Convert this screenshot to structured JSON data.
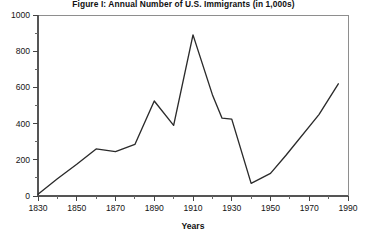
{
  "figure": {
    "title": "Figure I: Annual Number of U.S. Immigrants (in 1,000s)",
    "xlabel": "Years",
    "ylabel": ""
  },
  "chart_data": {
    "type": "line",
    "title": "Figure I: Annual Number of U.S. Immigrants (in 1,000s)",
    "xlabel": "Years",
    "ylabel": "",
    "xlim": [
      1830,
      1990
    ],
    "ylim": [
      0,
      1000
    ],
    "grid": false,
    "legend": null,
    "x_major_ticks": [
      1830,
      1850,
      1870,
      1890,
      1910,
      1930,
      1950,
      1970,
      1990
    ],
    "x_minor_tick_step": 10,
    "y_major_ticks": [
      0,
      200,
      400,
      600,
      800,
      1000
    ],
    "y_minor_tick_step": 100,
    "x_tick_labels": [
      "1830",
      "1850",
      "1870",
      "1890",
      "1910",
      "1930",
      "1950",
      "1970",
      "1990"
    ],
    "y_tick_labels": [
      "0",
      "200",
      "400",
      "600",
      "800",
      "1000"
    ],
    "series": [
      {
        "name": "Annual number of U.S. immigrants (thousands)",
        "x": [
          1830,
          1840,
          1850,
          1860,
          1870,
          1880,
          1890,
          1900,
          1910,
          1920,
          1925,
          1930,
          1940,
          1950,
          1958,
          1975,
          1985
        ],
        "values": [
          10,
          95,
          175,
          260,
          245,
          285,
          525,
          390,
          890,
          560,
          430,
          425,
          70,
          125,
          225,
          450,
          620
        ]
      }
    ]
  }
}
